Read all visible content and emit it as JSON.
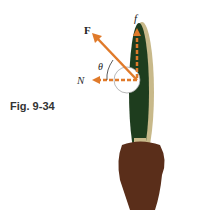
{
  "figure": {
    "caption": "Fig. 9-34",
    "labels": {
      "force": "F",
      "friction": "f",
      "normal": "N",
      "angle": "θ"
    },
    "colors": {
      "arrow": "#e07a2a",
      "paddle_face": "#1e3d1e",
      "paddle_edge": "#c8b98a",
      "hand": "#5a2e1a",
      "ball": "#ffffff",
      "text": "#222222"
    }
  }
}
